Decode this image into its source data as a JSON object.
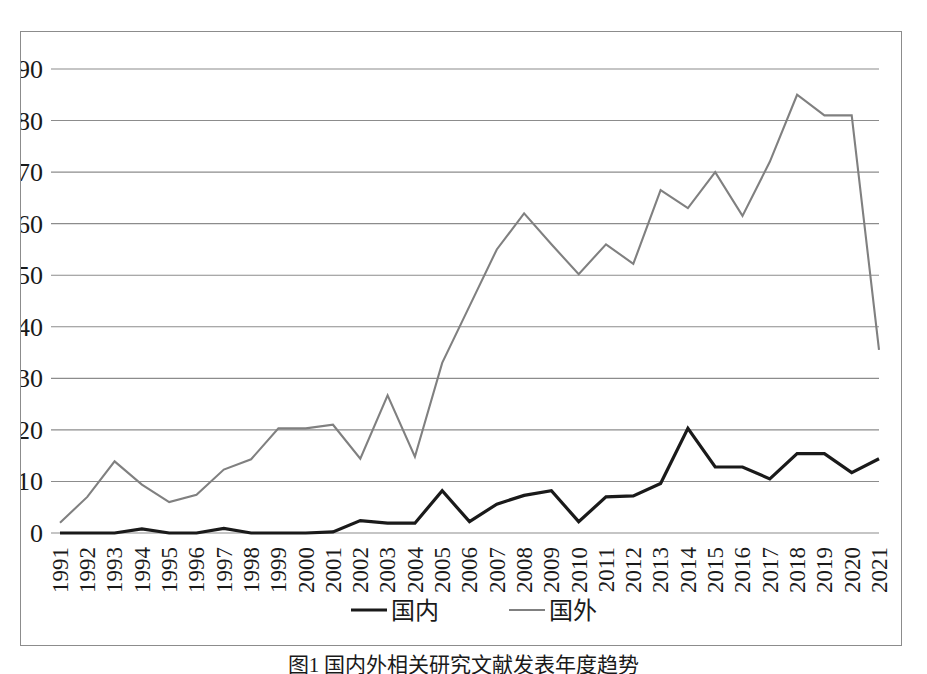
{
  "caption": "图1  国内外相关研究文献发表年度趋势",
  "legend": {
    "position": "bottom",
    "items": [
      {
        "label": "国内",
        "color": "#1a1a1a",
        "width": 3
      },
      {
        "label": "国外",
        "color": "#808080",
        "width": 2
      }
    ]
  },
  "axis": {
    "y_ticks": [
      "0",
      "10",
      "20",
      "30",
      "40",
      "50",
      "60",
      "70",
      "80",
      "90"
    ],
    "x_ticks": [
      "1991",
      "1992",
      "1993",
      "1994",
      "1995",
      "1996",
      "1997",
      "1998",
      "1999",
      "2000",
      "2001",
      "2002",
      "2003",
      "2004",
      "2005",
      "2006",
      "2007",
      "2008",
      "2009",
      "2010",
      "2011",
      "2012",
      "2013",
      "2014",
      "2015",
      "2016",
      "2017",
      "2018",
      "2019",
      "2020",
      "2021"
    ]
  },
  "style": {
    "grid_color": "#8c8c8c",
    "border_color": "#8c8c8c",
    "background": "#ffffff"
  },
  "chart_data": {
    "type": "line",
    "title": "",
    "xlabel": "",
    "ylabel": "",
    "ylim": [
      0,
      90
    ],
    "grid": true,
    "legend_position": "bottom",
    "categories": [
      "1991",
      "1992",
      "1993",
      "1994",
      "1995",
      "1996",
      "1997",
      "1998",
      "1999",
      "2000",
      "2001",
      "2002",
      "2003",
      "2004",
      "2005",
      "2006",
      "2007",
      "2008",
      "2009",
      "2010",
      "2011",
      "2012",
      "2013",
      "2014",
      "2015",
      "2016",
      "2017",
      "2018",
      "2019",
      "2020",
      "2021"
    ],
    "series": [
      {
        "name": "国内",
        "color": "#1a1a1a",
        "values": [
          0,
          0,
          0,
          0.8,
          0,
          0,
          0.9,
          0,
          0,
          0,
          0.2,
          2.4,
          1.9,
          1.9,
          8.2,
          2.2,
          5.6,
          7.3,
          8.2,
          2.2,
          7.0,
          7.2,
          9.6,
          20.3,
          12.8,
          12.8,
          10.5,
          15.4,
          15.4,
          11.7,
          14.4
        ]
      },
      {
        "name": "国外",
        "color": "#808080",
        "values": [
          2.0,
          7.0,
          13.9,
          9.4,
          6.0,
          7.4,
          12.3,
          14.3,
          20.3,
          20.3,
          21.0,
          14.4,
          26.7,
          14.8,
          33.0,
          44.0,
          55.0,
          62.0,
          56.0,
          50.2,
          56.0,
          52.2,
          66.5,
          63.0,
          70.0,
          61.5,
          72.0,
          85.0,
          81.0,
          81.0,
          35.5
        ]
      }
    ]
  }
}
